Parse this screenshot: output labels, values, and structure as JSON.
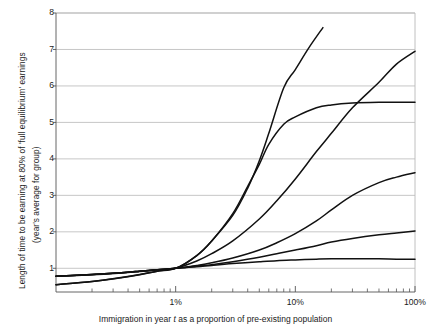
{
  "chart_data": {
    "type": "line",
    "title": "",
    "xlabel": "Immigration in year t as a proportion of pre-existing population",
    "ylabel": "Length of time to be earning at 80% of 'full equilibrium' earnings (year's average for group)",
    "ylabel_line1": "Length of time to be earning at 80% of 'full equilibrium' earnings",
    "ylabel_line2": "(year's average for group)",
    "xlabel_pre": "Immigration in year ",
    "xlabel_italic": "t",
    "xlabel_post": " as a proportion of pre-existing population",
    "x_scale": "log",
    "y_scale": "linear",
    "xlim": [
      0.1,
      100
    ],
    "ylim": [
      0.35,
      8
    ],
    "grid": "horizontal",
    "grid_color": "#b9b9b9",
    "axis_color": "#555555",
    "line_color": "#111111",
    "legend": "none",
    "x_tick_labels": [
      "1%",
      "10%",
      "100%"
    ],
    "x_tick_values": [
      1,
      10,
      100
    ],
    "x_minor_ticks": [
      0.2,
      0.3,
      0.4,
      0.5,
      0.6,
      0.7,
      0.8,
      0.9,
      2,
      3,
      4,
      5,
      6,
      7,
      8,
      9,
      20,
      30,
      40,
      50,
      60,
      70,
      80,
      90
    ],
    "y_tick_labels": [
      "1",
      "2",
      "3",
      "4",
      "5",
      "6",
      "7",
      "8"
    ],
    "y_tick_values": [
      1,
      2,
      3,
      4,
      5,
      6,
      7,
      8
    ],
    "convergence_point": {
      "x": 1,
      "y": 1
    },
    "series": [
      {
        "name": "steepest-curve",
        "points": [
          [
            0.1,
            0.55
          ],
          [
            0.2,
            0.64
          ],
          [
            0.35,
            0.74
          ],
          [
            0.5,
            0.82
          ],
          [
            0.7,
            0.92
          ],
          [
            1,
            1.0
          ],
          [
            1.5,
            1.35
          ],
          [
            2,
            1.75
          ],
          [
            3,
            2.45
          ],
          [
            4,
            3.2
          ],
          [
            5,
            3.95
          ],
          [
            6,
            4.7
          ],
          [
            8,
            5.95
          ],
          [
            10,
            6.45
          ],
          [
            13,
            7.05
          ],
          [
            17,
            7.6
          ]
        ]
      },
      {
        "name": "sigmoid-plateau-curve",
        "points": [
          [
            0.1,
            0.78
          ],
          [
            0.2,
            0.82
          ],
          [
            0.35,
            0.87
          ],
          [
            0.5,
            0.91
          ],
          [
            0.7,
            0.96
          ],
          [
            1,
            1.0
          ],
          [
            1.5,
            1.35
          ],
          [
            2,
            1.75
          ],
          [
            3,
            2.5
          ],
          [
            4,
            3.25
          ],
          [
            5,
            3.85
          ],
          [
            6,
            4.4
          ],
          [
            8,
            4.95
          ],
          [
            10,
            5.15
          ],
          [
            15,
            5.4
          ],
          [
            20,
            5.48
          ],
          [
            30,
            5.53
          ],
          [
            50,
            5.55
          ],
          [
            70,
            5.55
          ],
          [
            100,
            5.55
          ]
        ]
      },
      {
        "name": "near-linear-rising-curve",
        "points": [
          [
            0.1,
            0.55
          ],
          [
            0.2,
            0.64
          ],
          [
            0.35,
            0.75
          ],
          [
            0.5,
            0.83
          ],
          [
            0.7,
            0.92
          ],
          [
            1,
            1.0
          ],
          [
            1.5,
            1.2
          ],
          [
            2,
            1.4
          ],
          [
            3,
            1.75
          ],
          [
            5,
            2.35
          ],
          [
            7,
            2.85
          ],
          [
            10,
            3.45
          ],
          [
            15,
            4.2
          ],
          [
            20,
            4.7
          ],
          [
            30,
            5.4
          ],
          [
            50,
            6.1
          ],
          [
            70,
            6.6
          ],
          [
            100,
            6.95
          ]
        ]
      },
      {
        "name": "moderate-curve",
        "points": [
          [
            0.1,
            0.78
          ],
          [
            0.2,
            0.83
          ],
          [
            0.35,
            0.88
          ],
          [
            0.5,
            0.92
          ],
          [
            0.7,
            0.96
          ],
          [
            1,
            1.0
          ],
          [
            1.5,
            1.08
          ],
          [
            2,
            1.15
          ],
          [
            3,
            1.28
          ],
          [
            5,
            1.5
          ],
          [
            7,
            1.7
          ],
          [
            10,
            1.95
          ],
          [
            15,
            2.3
          ],
          [
            20,
            2.6
          ],
          [
            30,
            3.0
          ],
          [
            50,
            3.35
          ],
          [
            70,
            3.5
          ],
          [
            100,
            3.62
          ]
        ]
      },
      {
        "name": "shallow-curve",
        "points": [
          [
            0.1,
            0.78
          ],
          [
            0.2,
            0.83
          ],
          [
            0.35,
            0.88
          ],
          [
            0.5,
            0.92
          ],
          [
            0.7,
            0.96
          ],
          [
            1,
            1.0
          ],
          [
            1.5,
            1.06
          ],
          [
            2,
            1.1
          ],
          [
            3,
            1.18
          ],
          [
            5,
            1.3
          ],
          [
            7,
            1.4
          ],
          [
            10,
            1.5
          ],
          [
            15,
            1.62
          ],
          [
            20,
            1.72
          ],
          [
            30,
            1.82
          ],
          [
            50,
            1.92
          ],
          [
            70,
            1.97
          ],
          [
            100,
            2.02
          ]
        ]
      },
      {
        "name": "flattest-curve",
        "points": [
          [
            0.1,
            0.78
          ],
          [
            0.2,
            0.83
          ],
          [
            0.35,
            0.88
          ],
          [
            0.5,
            0.92
          ],
          [
            0.7,
            0.96
          ],
          [
            1,
            1.0
          ],
          [
            1.5,
            1.04
          ],
          [
            2,
            1.08
          ],
          [
            3,
            1.13
          ],
          [
            5,
            1.18
          ],
          [
            7,
            1.21
          ],
          [
            10,
            1.23
          ],
          [
            15,
            1.25
          ],
          [
            20,
            1.26
          ],
          [
            30,
            1.26
          ],
          [
            50,
            1.26
          ],
          [
            70,
            1.25
          ],
          [
            100,
            1.25
          ]
        ]
      }
    ]
  }
}
